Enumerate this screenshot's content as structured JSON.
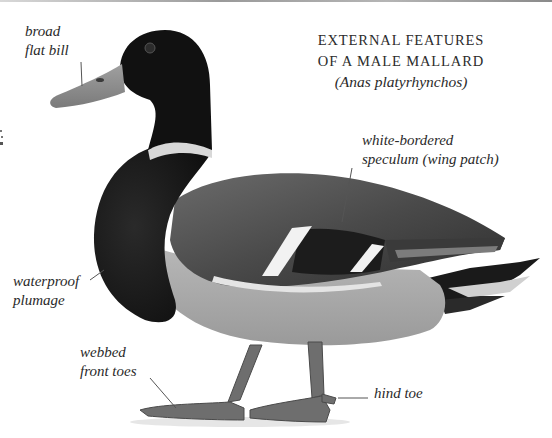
{
  "figure": {
    "title_lines": [
      "EXTERNAL FEATURES",
      "OF A MALE MALLARD"
    ],
    "scientific_name": "(Anas platyrhynchos)"
  },
  "labels": {
    "bill": {
      "lines": [
        "broad",
        "flat bill"
      ]
    },
    "speculum": {
      "lines": [
        "white-bordered",
        "speculum (wing patch)"
      ]
    },
    "plumage": {
      "lines": [
        "waterproof",
        "plumage"
      ]
    },
    "front_toes": {
      "lines": [
        "webbed",
        "front toes"
      ]
    },
    "hind_toe": {
      "lines": [
        "hind toe"
      ]
    }
  },
  "colors": {
    "background": "#ffffff",
    "text": "#2a2a2a",
    "leader_line": "#555555",
    "head": "#111111",
    "bill": "#8f8f8f",
    "breast": "#1e1e1e",
    "wing": "#5a5a5a",
    "belly": "#a8a8a8",
    "legs": "#6e6e6e"
  }
}
